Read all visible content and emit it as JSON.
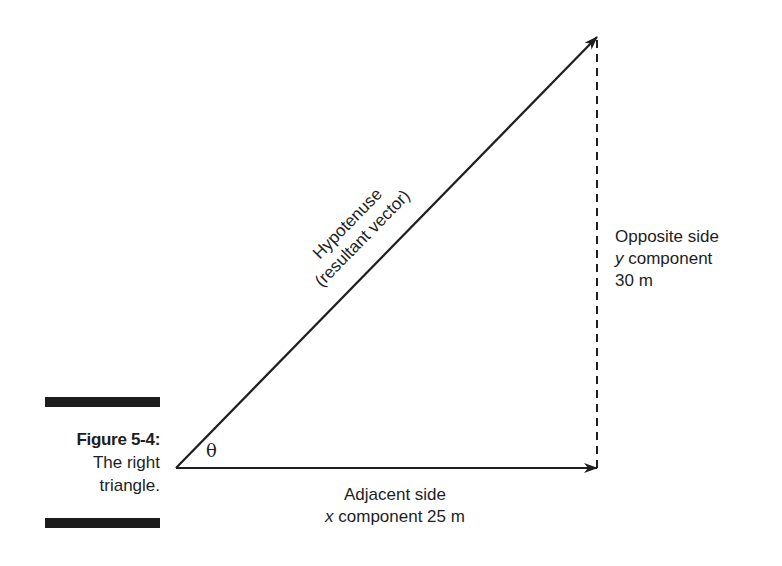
{
  "figure": {
    "number_label": "Figure 5-4:",
    "caption_line1": "The right",
    "caption_line2": "triangle."
  },
  "diagram": {
    "angle_symbol": "θ",
    "hypotenuse": {
      "line1": "Hypotenuse",
      "line2": "(resultant vector)"
    },
    "opposite": {
      "line1": "Opposite side",
      "var": "y",
      "line2_rest": " component",
      "line3": "30 m"
    },
    "adjacent": {
      "line1": "Adjacent side",
      "var": "x",
      "line2_rest": " component 25 m"
    },
    "colors": {
      "ink": "#1e1e1e"
    }
  }
}
